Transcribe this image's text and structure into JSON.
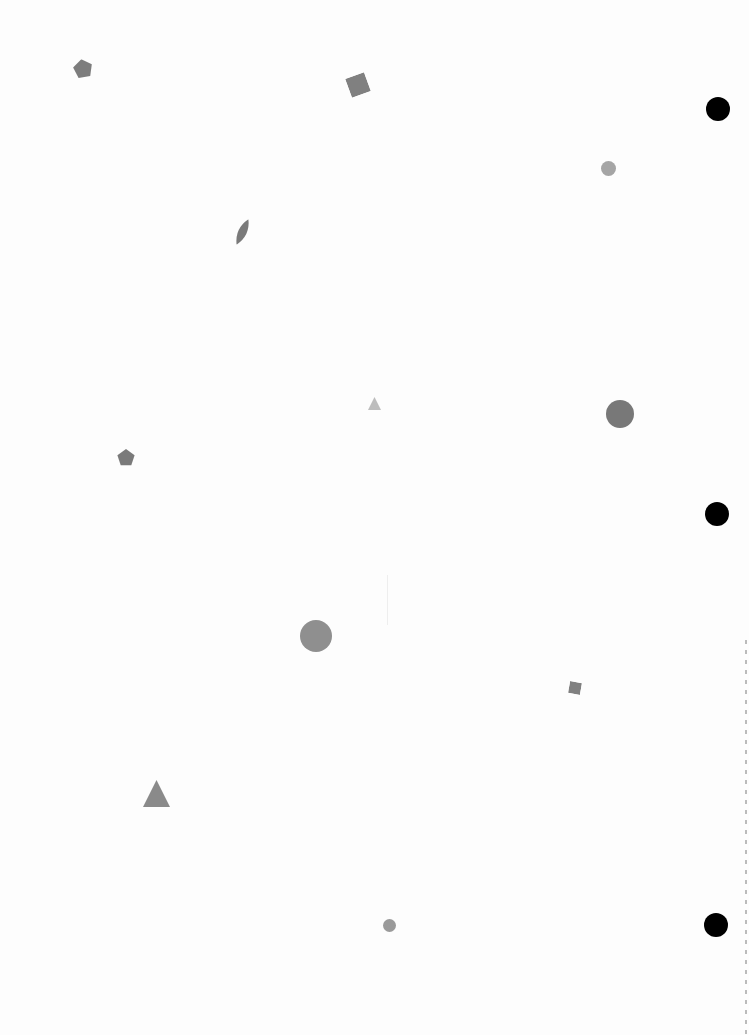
{
  "page": {
    "background": "#fdfdfd",
    "width": 749,
    "height": 1035
  },
  "shapes": [
    {
      "type": "pentagon",
      "x": 73,
      "y": 59,
      "size": 20,
      "color": "#7d7d7d",
      "rotate": -10
    },
    {
      "type": "square",
      "x": 348,
      "y": 75,
      "size": 20,
      "color": "#808080",
      "rotate": -20
    },
    {
      "type": "circle",
      "x": 706,
      "y": 97,
      "size": 24,
      "color": "#000000"
    },
    {
      "type": "circle",
      "x": 601,
      "y": 161,
      "size": 15,
      "color": "#a5a5a5"
    },
    {
      "type": "leaf",
      "x": 234,
      "y": 218,
      "w": 17,
      "h": 28,
      "color": "#7a7a7a",
      "rotate": 25
    },
    {
      "type": "triangle",
      "x": 368,
      "y": 397,
      "size": 13,
      "color": "#bdbdbd"
    },
    {
      "type": "circle",
      "x": 606,
      "y": 400,
      "size": 28,
      "color": "#787878"
    },
    {
      "type": "pentagon",
      "x": 117,
      "y": 449,
      "size": 18,
      "color": "#7a7a7a",
      "rotate": 0
    },
    {
      "type": "circle",
      "x": 705,
      "y": 502,
      "size": 24,
      "color": "#000000"
    },
    {
      "type": "circle",
      "x": 300,
      "y": 620,
      "size": 32,
      "color": "#8f8f8f"
    },
    {
      "type": "square",
      "x": 569,
      "y": 682,
      "size": 12,
      "color": "#808080",
      "rotate": 10
    },
    {
      "type": "triangle",
      "x": 143,
      "y": 780,
      "size": 27,
      "color": "#8a8a8a"
    },
    {
      "type": "circle",
      "x": 383,
      "y": 919,
      "size": 13,
      "color": "#9a9a9a"
    },
    {
      "type": "circle",
      "x": 704,
      "y": 913,
      "size": 24,
      "color": "#000000"
    }
  ]
}
